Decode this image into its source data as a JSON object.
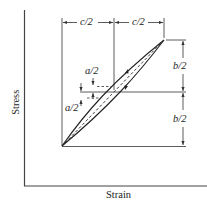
{
  "diagram": {
    "type": "stress-strain hysteresis loop",
    "axes": {
      "x_label": "Strain",
      "y_label": "Stress"
    },
    "dimensions": {
      "horizontal_left": "c/2",
      "horizontal_right": "c/2",
      "vertical_top": "b/2",
      "vertical_bottom": "b/2",
      "offset_upper": "a/2",
      "offset_lower": "a/2"
    },
    "colors": {
      "line": "#333333",
      "background": "#ffffff"
    }
  }
}
